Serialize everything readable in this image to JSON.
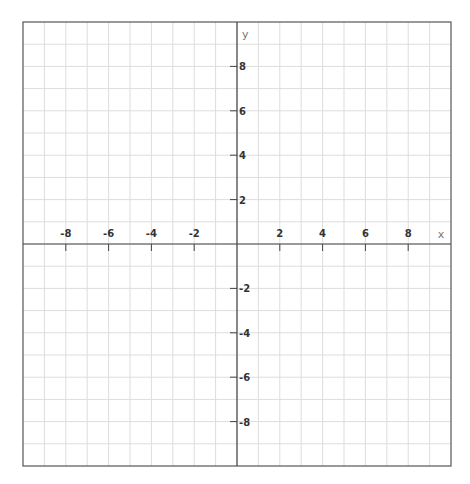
{
  "chart_data": {
    "type": "line",
    "title": "",
    "xlabel": "x",
    "ylabel": "y",
    "xlim": [
      -10,
      10
    ],
    "ylim": [
      -10,
      10
    ],
    "grid": true,
    "grid_step": 1,
    "x_ticks": [
      -8,
      -6,
      -4,
      -2,
      2,
      4,
      6,
      8
    ],
    "x_tick_labels": [
      "-8",
      "-6",
      "-4",
      "-2",
      "2",
      "4",
      "6",
      "8"
    ],
    "y_ticks": [
      8,
      6,
      4,
      2,
      -2,
      -4,
      -6,
      -8
    ],
    "y_tick_labels": [
      "8",
      "6",
      "4",
      "2",
      "-2",
      "-4",
      "-6",
      "-8"
    ],
    "series": [],
    "legend": null
  },
  "colors": {
    "grid": "#dddddd",
    "axis": "#444444",
    "border": "#555555",
    "tick_label": "#333333",
    "axis_name": "#777777"
  },
  "labels": {
    "x_axis": "x",
    "y_axis": "y"
  }
}
